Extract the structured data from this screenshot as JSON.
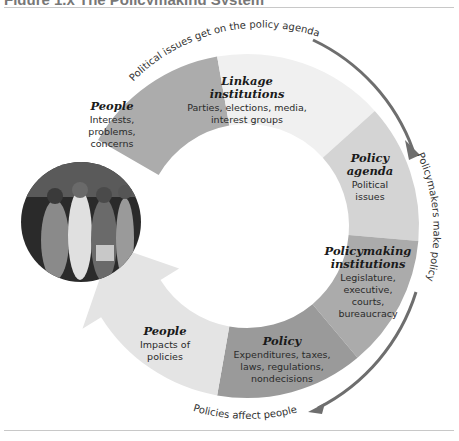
{
  "figure": {
    "title": "Figure 1.x  The Policymaking System"
  },
  "photo": {
    "description": "Black-and-white photo of a crowd of young people walking together"
  },
  "segments": [
    {
      "id": "people-input",
      "title": "People",
      "lines": [
        "Interests,",
        "problems,",
        "concerns"
      ],
      "color": "#acacac"
    },
    {
      "id": "linkage",
      "title_lines": [
        "Linkage",
        "institutions"
      ],
      "lines": [
        "Parties, elections, media,",
        "interest groups"
      ],
      "color": "#f0f0f0"
    },
    {
      "id": "agenda",
      "title_lines": [
        "Policy",
        "agenda"
      ],
      "lines": [
        "Political",
        "issues"
      ],
      "color": "#d4d4d4"
    },
    {
      "id": "policymaking",
      "title_lines": [
        "Policymaking",
        "institutions"
      ],
      "lines": [
        "Legislature,",
        "executive,",
        "courts,",
        "bureaucracy"
      ],
      "color": "#ababab"
    },
    {
      "id": "policy",
      "title": "Policy",
      "lines": [
        "Expenditures, taxes,",
        "laws, regulations,",
        "nondecisions"
      ],
      "color": "#9a9a9a"
    },
    {
      "id": "people-output",
      "title": "People",
      "lines": [
        "Impacts of",
        "policies"
      ],
      "color": "#e4e4e4"
    }
  ],
  "arc_labels": {
    "top": "Political issues get on the policy agenda",
    "right": "Policymakers make policy",
    "bottom": "Policies affect people"
  },
  "colors": {
    "arrow": "#6e6e6e"
  }
}
